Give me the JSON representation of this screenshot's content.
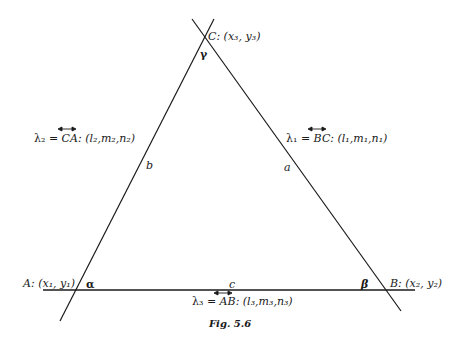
{
  "figure": {
    "caption": "Fig. 5.6",
    "vertices": {
      "A": {
        "label": "A: (x₁, y₁)",
        "angle": "α"
      },
      "B": {
        "label": "B: (x₂, y₂)",
        "angle": "β"
      },
      "C": {
        "label": "C: (x₃, y₃)",
        "angle": "γ"
      }
    },
    "sides": {
      "a": "a",
      "b": "b",
      "c": "c"
    },
    "lines": {
      "lambda1": {
        "name": "λ₁ = ",
        "segment": "BC",
        "dir": ": (l₁,m₁,n₁)"
      },
      "lambda2": {
        "name": "λ₂ = ",
        "segment": "CA",
        "dir": ": (l₂,m₂,n₂)"
      },
      "lambda3": {
        "name": "λ₃ = ",
        "segment": "AB",
        "dir": ": (l₃,m₃,n₃)"
      }
    },
    "colors": {
      "stroke": "#1a1a1a",
      "background": "#ffffff"
    }
  }
}
